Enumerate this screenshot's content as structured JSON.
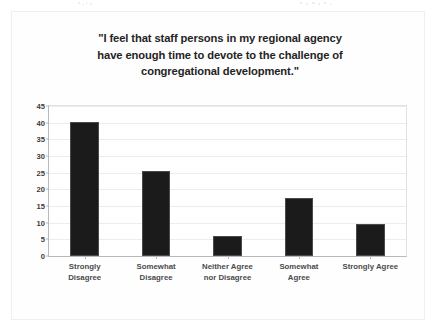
{
  "figure": {
    "title_lines": [
      "\"I feel that staff persons in my regional agency",
      "have enough time to devote to the challenge of",
      "congregational development.\""
    ],
    "background_color": "#fefefe",
    "frame_color": "#efeff1"
  },
  "chart_data": {
    "type": "bar",
    "xlabel": "",
    "ylabel": "",
    "categories": [
      "Strongly Disagree",
      "Somewhat Disagree",
      "Neither Agree nor Disagree",
      "Somewhat Agree",
      "Strongly Agree"
    ],
    "category_lines": [
      [
        "Strongly",
        "Disagree"
      ],
      [
        "Somewhat",
        "Disagree"
      ],
      [
        "Neither Agree",
        "nor Disagree"
      ],
      [
        "Somewhat",
        "Agree"
      ],
      [
        "Strongly Agree"
      ]
    ],
    "values": [
      40.3,
      25.5,
      6.0,
      17.3,
      9.7
    ],
    "ylim": [
      0,
      45
    ],
    "ytick_values": [
      0,
      5,
      10,
      15,
      20,
      25,
      30,
      35,
      40,
      45
    ],
    "ytick_labels": [
      "0",
      "5",
      "10",
      "15",
      "20",
      "25",
      "30",
      "35",
      "40",
      "45"
    ],
    "grid": true,
    "legend": false,
    "bar_color": "#1b1b1b",
    "bar_edge_color": "#4a4a4a",
    "gridline_color": "#ececef",
    "axis_color": "#b9b9bd"
  }
}
